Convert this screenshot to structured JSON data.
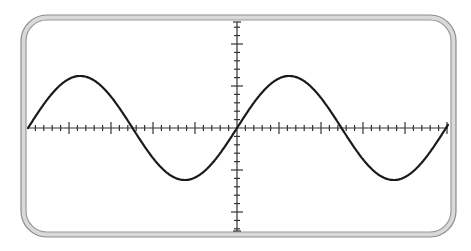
{
  "diagram": {
    "frame": {
      "x": 21,
      "y": 15,
      "width": 435,
      "height": 222,
      "radius": 26,
      "band": 5,
      "outer_color": "#8c8c8c",
      "band_color": "#d9d9d9",
      "inner_color": "#9a9a9a"
    },
    "axes": {
      "x_axis_y": 128,
      "y_axis_x": 237,
      "x_start": 28,
      "x_end": 448,
      "y_start": 22,
      "y_end": 231,
      "tick_spacing": 8.4,
      "major_every": 5,
      "minor_len": 3,
      "major_len": 6,
      "color": "#333333"
    },
    "wave": {
      "type": "sine",
      "x0": 28,
      "x1": 448,
      "period": 209,
      "amplitude": 52,
      "phase_start_x": 28,
      "color": "#1a1a1a",
      "stroke_width": 2.2
    },
    "caption": "Sine wave on oscilloscope grid"
  }
}
